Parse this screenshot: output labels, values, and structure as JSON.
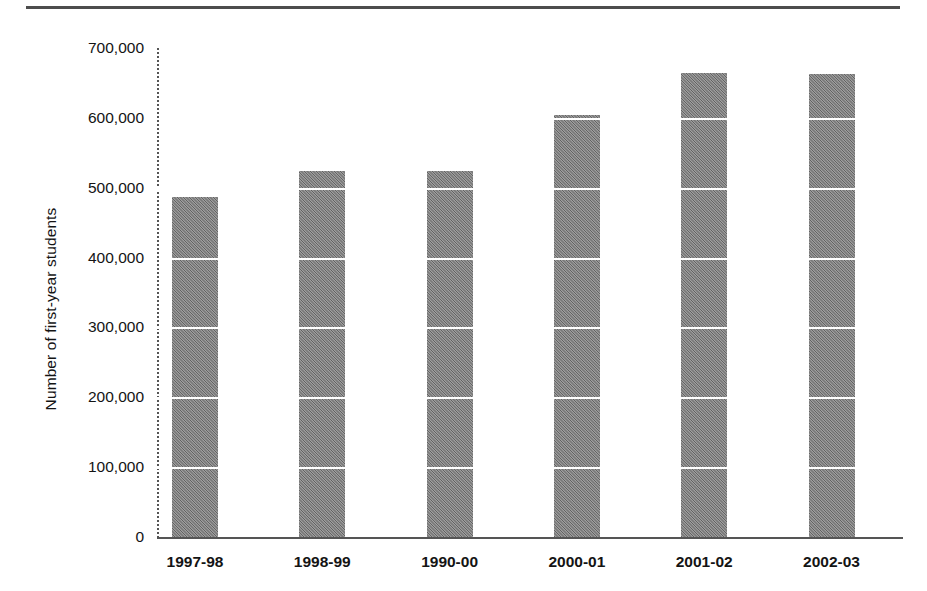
{
  "chart_data": {
    "type": "bar",
    "title": "",
    "subtitle": "",
    "xlabel": "",
    "ylabel": "Number of first-year students",
    "categories": [
      "1997-98",
      "1998-99",
      "1990-00",
      "2000-01",
      "2001-02",
      "2002-03"
    ],
    "values": [
      487000,
      524000,
      524000,
      604000,
      664000,
      663000
    ],
    "ylim": [
      0,
      700000
    ],
    "ytick_values": [
      0,
      100000,
      200000,
      300000,
      400000,
      500000,
      600000,
      700000
    ],
    "ytick_labels": [
      "0",
      "100,000",
      "200,000",
      "300,000",
      "400,000",
      "500,000",
      "600,000",
      "700,000"
    ],
    "grid": "horizontal-white-over-bars",
    "legend": null,
    "legend_position": "none",
    "bar_color": "#7d7d7d",
    "axis_color": "#555555",
    "text_color": "#141414",
    "gridline_color": "#ffffff"
  },
  "figure": {
    "top_rule": "horizontal-rule",
    "y_axis_title": "Number of first-year students",
    "y_axis_style": "dotted",
    "x_axis_style": "solid"
  }
}
